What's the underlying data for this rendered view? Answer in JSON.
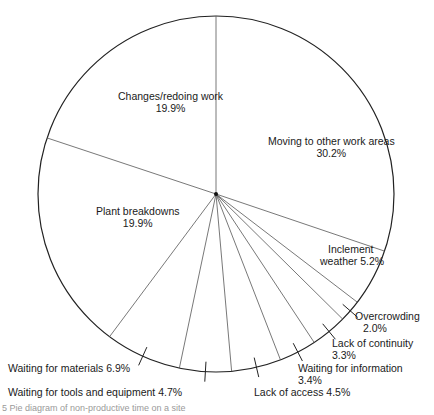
{
  "chart_data": {
    "type": "pie",
    "title": "",
    "start_angle": "12 o'clock",
    "direction": "clockwise",
    "slices": [
      {
        "label": "Moving to other work areas",
        "value": 30.2
      },
      {
        "label": "Inclement weather",
        "value": 5.2
      },
      {
        "label": "Overcrowding",
        "value": 2.0
      },
      {
        "label": "Lack of continuity",
        "value": 3.3
      },
      {
        "label": "Waiting for information",
        "value": 3.4
      },
      {
        "label": "Lack of access",
        "value": 4.5
      },
      {
        "label": "Waiting for tools and equipment",
        "value": 4.7
      },
      {
        "label": "Waiting for materials",
        "value": 6.9
      },
      {
        "label": "Plant breakdowns",
        "value": 19.9
      },
      {
        "label": "Changes/redoing work",
        "value": 19.9
      }
    ],
    "units": "%"
  },
  "labels": {
    "moving": {
      "name": "Moving to other work areas",
      "pct": "30.2%"
    },
    "inclement": {
      "line1": "Inclement",
      "line2": "weather  5.2%"
    },
    "overcrowding": {
      "name": "Overcrowding",
      "pct": "2.0%"
    },
    "continuity": {
      "name": "Lack of continuity",
      "pct": "3.3%"
    },
    "information": {
      "name": "Waiting for information",
      "pct": "3.4%"
    },
    "access": {
      "text": "Lack of access  4.5%"
    },
    "tools": {
      "text": "Waiting for tools and equipment  4.7%"
    },
    "materials": {
      "text": "Waiting for materials  6.9%"
    },
    "plant": {
      "name": "Plant breakdowns",
      "pct": "19.9%"
    },
    "changes": {
      "name": "Changes/redoing work",
      "pct": "19.9%"
    }
  },
  "caption": "5   Pie diagram of non-productive time on a site"
}
